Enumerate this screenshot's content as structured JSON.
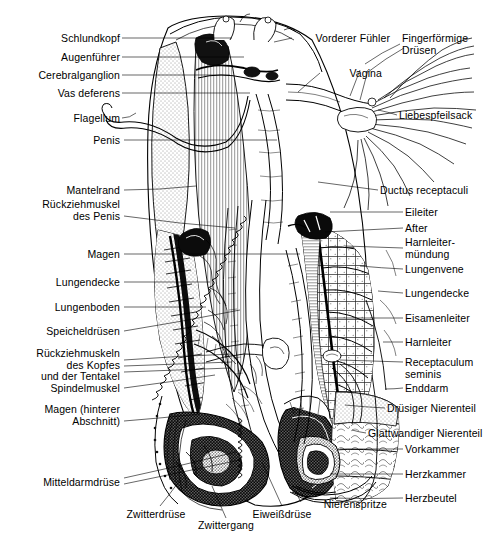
{
  "figure": {
    "background_color": "#ffffff",
    "ink_color": "#000000",
    "width": 499,
    "height": 546
  },
  "labels_left": [
    {
      "id": "schlundkopf",
      "text": "Schlundkopf",
      "x": 34,
      "y": 33,
      "w": 86,
      "leader": {
        "x1": 122,
        "y1": 38,
        "x2": 232,
        "y2": 38
      }
    },
    {
      "id": "augenfuehler",
      "text": "Augenführer",
      "x": 28,
      "y": 52,
      "w": 92,
      "leader": {
        "x1": 122,
        "y1": 57,
        "x2": 244,
        "y2": 57
      }
    },
    {
      "id": "cerebralganglion",
      "text": "Cerebralganglion",
      "x": 8,
      "y": 70,
      "w": 112,
      "leader": {
        "x1": 122,
        "y1": 75,
        "x2": 230,
        "y2": 75
      }
    },
    {
      "id": "vas-deferens",
      "text": "Vas deferens",
      "x": 29,
      "y": 88,
      "w": 91,
      "leader": {
        "x1": 122,
        "y1": 93,
        "x2": 250,
        "y2": 93
      }
    },
    {
      "id": "flagellum",
      "text": "Flagellum",
      "x": 44,
      "y": 113,
      "w": 76,
      "leader": {
        "x1": 122,
        "y1": 118,
        "x2": 136,
        "y2": 113
      }
    },
    {
      "id": "penis",
      "text": "Penis",
      "x": 67,
      "y": 135,
      "w": 53,
      "leader": {
        "x1": 124,
        "y1": 140,
        "x2": 277,
        "y2": 140
      }
    },
    {
      "id": "mantelrand",
      "text": "Mantelrand",
      "x": 39,
      "y": 185,
      "w": 81,
      "leader": {
        "x1": 124,
        "y1": 190,
        "x2": 196,
        "y2": 186
      }
    },
    {
      "id": "rueckziehmuskel-penis",
      "text": "Rückziehmuskel\ndes Penis",
      "x": 18,
      "y": 199,
      "w": 102,
      "leader": {
        "x1": 124,
        "y1": 216,
        "x2": 235,
        "y2": 228
      }
    },
    {
      "id": "magen",
      "text": "Magen",
      "x": 64,
      "y": 249,
      "w": 56,
      "leader": {
        "x1": 124,
        "y1": 254,
        "x2": 300,
        "y2": 254
      }
    },
    {
      "id": "lungendecke-links",
      "text": "Lungendecke",
      "x": 30,
      "y": 277,
      "w": 90,
      "leader": {
        "x1": 124,
        "y1": 282,
        "x2": 210,
        "y2": 282
      }
    },
    {
      "id": "lungenboden",
      "text": "Lungenboden",
      "x": 28,
      "y": 302,
      "w": 92,
      "leader": {
        "x1": 124,
        "y1": 307,
        "x2": 206,
        "y2": 307
      }
    },
    {
      "id": "speicheldruesen",
      "text": "Speicheldrüsen",
      "x": 21,
      "y": 326,
      "w": 99,
      "leader": {
        "x1": 124,
        "y1": 331,
        "x2": 240,
        "y2": 310
      }
    },
    {
      "id": "rueckziehmuskeln-kopf",
      "text": "Rückziehmuskeln\ndes Kopfes\nund der Tentakel",
      "x": 10,
      "y": 348,
      "w": 110,
      "leader": {
        "x1": 124,
        "y1": 365,
        "x2": 232,
        "y2": 358
      }
    },
    {
      "id": "spindelmuskel",
      "text": "Spindelmuskel",
      "x": 25,
      "y": 383,
      "w": 95,
      "leader": {
        "x1": 124,
        "y1": 388,
        "x2": 215,
        "y2": 375
      }
    },
    {
      "id": "magen-hinterer",
      "text": "Magen (hinterer\nAbschnitt)",
      "x": 20,
      "y": 404,
      "w": 100,
      "leader": {
        "x1": 124,
        "y1": 421,
        "x2": 200,
        "y2": 414
      }
    },
    {
      "id": "mitteldarmdruese",
      "text": "Mitteldarmdrüse",
      "x": 20,
      "y": 477,
      "w": 100,
      "leader": {
        "x1": 124,
        "y1": 482,
        "x2": 235,
        "y2": 455
      }
    }
  ],
  "labels_right": [
    {
      "id": "fingerfoermige-druesen",
      "text": "Fingerförmige\nDrüsen",
      "x": 402,
      "y": 33,
      "w": 95,
      "leader": {
        "x1": 400,
        "y1": 44,
        "x2": 365,
        "y2": 64
      }
    },
    {
      "id": "liebespfeilsack",
      "text": "Liebespfeilsack",
      "x": 399,
      "y": 110,
      "w": 98,
      "leader": {
        "x1": 397,
        "y1": 115,
        "x2": 378,
        "y2": 110
      }
    },
    {
      "id": "ductus-receptaculi",
      "text": "Ductus receptaculi",
      "x": 380,
      "y": 185,
      "w": 118,
      "leader": {
        "x1": 378,
        "y1": 190,
        "x2": 318,
        "y2": 182
      }
    },
    {
      "id": "eileiter",
      "text": "Eileiter",
      "x": 405,
      "y": 207,
      "w": 92,
      "leader": {
        "x1": 403,
        "y1": 212,
        "x2": 330,
        "y2": 212
      }
    },
    {
      "id": "after",
      "text": "After",
      "x": 405,
      "y": 223,
      "w": 92,
      "leader": {
        "x1": 403,
        "y1": 228,
        "x2": 325,
        "y2": 232
      }
    },
    {
      "id": "harnleitermuendung",
      "text": "Harnleiter-\nmündung",
      "x": 405,
      "y": 237,
      "w": 92,
      "leader": {
        "x1": 403,
        "y1": 248,
        "x2": 345,
        "y2": 246
      }
    },
    {
      "id": "lungenvene",
      "text": "Lungenvene",
      "x": 405,
      "y": 264,
      "w": 92,
      "leader": {
        "x1": 403,
        "y1": 269,
        "x2": 360,
        "y2": 266
      }
    },
    {
      "id": "lungendecke-rechts",
      "text": "Lungendecke",
      "x": 405,
      "y": 288,
      "w": 92,
      "leader": {
        "x1": 403,
        "y1": 293,
        "x2": 378,
        "y2": 291
      }
    },
    {
      "id": "eisamenleiter",
      "text": "Eisamenleiter",
      "x": 405,
      "y": 313,
      "w": 92,
      "leader": {
        "x1": 403,
        "y1": 318,
        "x2": 330,
        "y2": 318
      }
    },
    {
      "id": "harnleiter",
      "text": "Harnleiter",
      "x": 405,
      "y": 337,
      "w": 92,
      "leader": {
        "x1": 403,
        "y1": 342,
        "x2": 383,
        "y2": 342
      }
    },
    {
      "id": "receptaculum-seminis",
      "text": "Receptaculum\nseminis",
      "x": 405,
      "y": 357,
      "w": 92,
      "leader": {
        "x1": 403,
        "y1": 362,
        "x2": 340,
        "y2": 360
      }
    },
    {
      "id": "enddarm",
      "text": "Enddarm",
      "x": 405,
      "y": 383,
      "w": 92,
      "leader": {
        "x1": 403,
        "y1": 388,
        "x2": 385,
        "y2": 389
      }
    },
    {
      "id": "druesiger-nierenteil",
      "text": "Drüsiger Nierenteil",
      "x": 387,
      "y": 403,
      "w": 110,
      "leader": {
        "x1": 385,
        "y1": 408,
        "x2": 345,
        "y2": 405
      }
    },
    {
      "id": "glattwandiger-nierenteil",
      "text": "Glattwandiger Nierenteil",
      "x": 368,
      "y": 428,
      "w": 130,
      "leader": {
        "x1": 366,
        "y1": 433,
        "x2": 352,
        "y2": 430
      }
    },
    {
      "id": "vorkammer",
      "text": "Vorkammer",
      "x": 405,
      "y": 444,
      "w": 92,
      "leader": {
        "x1": 403,
        "y1": 449,
        "x2": 340,
        "y2": 449
      }
    },
    {
      "id": "herzkammer",
      "text": "Herzkammer",
      "x": 405,
      "y": 469,
      "w": 92,
      "leader": {
        "x1": 403,
        "y1": 474,
        "x2": 330,
        "y2": 474
      }
    },
    {
      "id": "herzbeutel",
      "text": "Herzbeutel",
      "x": 405,
      "y": 493,
      "w": 92,
      "leader": {
        "x1": 403,
        "y1": 498,
        "x2": 330,
        "y2": 498
      }
    }
  ],
  "labels_inner": [
    {
      "id": "vorderer-fuehler",
      "text": "Vorderer Fühler",
      "x": 294,
      "y": 33,
      "w": 96,
      "align": "left",
      "leader": {
        "x1": 292,
        "y1": 38,
        "x2": 274,
        "y2": 42
      }
    },
    {
      "id": "vagina",
      "text": "Vagina",
      "x": 322,
      "y": 68,
      "w": 60,
      "align": "left",
      "leader": {
        "x1": 320,
        "y1": 73,
        "x2": 298,
        "y2": 92
      }
    }
  ],
  "labels_bottom": [
    {
      "id": "zwitterdruese",
      "text": "Zwitterdrüse",
      "x": 115,
      "y": 509,
      "w": 82,
      "align": "center",
      "leader": {
        "x1": 160,
        "y1": 506,
        "x2": 180,
        "y2": 480
      }
    },
    {
      "id": "zwittergang",
      "text": "Zwittergang",
      "x": 186,
      "y": 520,
      "w": 80,
      "align": "center",
      "leader": {
        "x1": 226,
        "y1": 518,
        "x2": 212,
        "y2": 486
      }
    },
    {
      "id": "eiweissdruese",
      "text": "Eiweißdrüse",
      "x": 240,
      "y": 509,
      "w": 84,
      "align": "center",
      "leader": {
        "x1": 282,
        "y1": 506,
        "x2": 262,
        "y2": 462
      }
    },
    {
      "id": "nierenspritze",
      "text": "Nierenspritze",
      "x": 303,
      "y": 499,
      "w": 84,
      "align": "left",
      "leader": {
        "x1": 301,
        "y1": 502,
        "x2": 296,
        "y2": 492
      }
    }
  ],
  "caption": {
    "text": "",
    "visible": false
  }
}
